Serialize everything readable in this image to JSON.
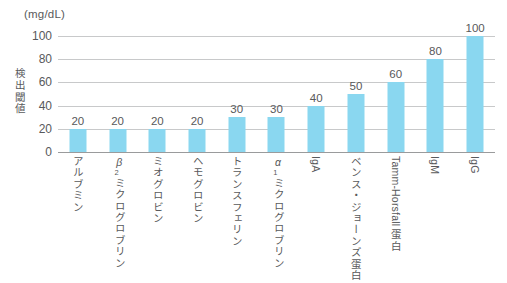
{
  "chart_data": {
    "type": "bar",
    "title": "",
    "subtitle": "",
    "unit_caption": "(mg/dL)",
    "ylabel": "検出閾値",
    "xlabel": "",
    "ylim": [
      0,
      100
    ],
    "ytick_labels": [
      "100",
      "80",
      "60",
      "40",
      "20",
      "0"
    ],
    "ytick_values": [
      100,
      80,
      60,
      40,
      20,
      0
    ],
    "grid": "horizontal",
    "legend": "none",
    "categories": [
      "アルブミン",
      "β₂ミクログロブリン",
      "ミオグロビン",
      "ヘモグロビン",
      "トランスフェリン",
      "α₁ミクログロブリン",
      "IgA",
      "ベンス・ジョーンズ蛋白",
      "Tamm-Horsfall 蛋白",
      "IgM",
      "IgG"
    ],
    "category_parts": [
      {
        "prefix": "",
        "sub": "",
        "body": "アルブミン",
        "latin": false
      },
      {
        "prefix": "β",
        "sub": "2",
        "body": "ミクログロブリン",
        "latin": false
      },
      {
        "prefix": "",
        "sub": "",
        "body": "ミオグロビン",
        "latin": false
      },
      {
        "prefix": "",
        "sub": "",
        "body": "ヘモグロビン",
        "latin": false
      },
      {
        "prefix": "",
        "sub": "",
        "body": "トランスフェリン",
        "latin": false
      },
      {
        "prefix": "α",
        "sub": "1",
        "body": "ミクログロブリン",
        "latin": false
      },
      {
        "prefix": "",
        "sub": "",
        "body": "IgA",
        "latin": true
      },
      {
        "prefix": "",
        "sub": "",
        "body": "ベンス・ジョーンズ蛋白",
        "latin": false
      },
      {
        "prefix": "",
        "sub": "",
        "body": "Tamm-Horsfall 蛋白",
        "latin": true
      },
      {
        "prefix": "",
        "sub": "",
        "body": "IgM",
        "latin": true
      },
      {
        "prefix": "",
        "sub": "",
        "body": "IgG",
        "latin": true
      }
    ],
    "values": [
      20,
      20,
      20,
      20,
      30,
      30,
      40,
      50,
      60,
      80,
      100
    ],
    "value_labels": [
      "20",
      "20",
      "20",
      "20",
      "30",
      "30",
      "40",
      "50",
      "60",
      "80",
      "100"
    ],
    "colors": {
      "bar": "#8AD7F0",
      "gridline": "#C8C9CA",
      "axis": "#9A9B9C",
      "text": "#58595B",
      "background": "#FFFFFF"
    }
  }
}
